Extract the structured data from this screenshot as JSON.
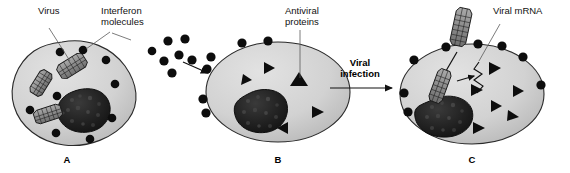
{
  "figure": {
    "background": "#ffffff",
    "cell_fill": "#d2d2d2",
    "nucleus_fill": "#1c1c1c",
    "particle_color": "#0d0d0d"
  },
  "labels": {
    "virus": "Virus",
    "interferon_line1": "Interferon",
    "interferon_line2": "molecules",
    "antiviral_line1": "Antiviral",
    "antiviral_line2": "proteins",
    "viral_infection_line1": "Viral",
    "viral_infection_line2": "infection",
    "viral_mrna": "Viral mRNA"
  },
  "panels": [
    {
      "id": "A",
      "letter": "A",
      "shape": "irregular-amoeboid",
      "virus_count": 3,
      "interferon_dot_count": 9,
      "antiviral_triangle_count": 0,
      "has_nucleus": true,
      "description": "Virus-infected cell producing interferon molecules"
    },
    {
      "id": "B",
      "letter": "B",
      "shape": "oval",
      "virus_count": 0,
      "interferon_dot_count": 6,
      "antiviral_triangle_count": 5,
      "has_nucleus": true,
      "description": "Neighbouring cell binding interferon and making antiviral proteins"
    },
    {
      "id": "C",
      "letter": "C",
      "shape": "oval",
      "virus_count": 2,
      "interferon_dot_count": 8,
      "antiviral_triangle_count": 6,
      "has_nucleus": true,
      "description": "Cell infected by virus; antiviral proteins block viral mRNA"
    }
  ],
  "free_interferon_cluster": {
    "count": 7,
    "description": "Interferon molecules released between cell A and cell B"
  },
  "arrows": [
    {
      "name": "interferon-diffusion-arrow",
      "from": "A",
      "to": "B"
    },
    {
      "name": "viral-infection-arrow",
      "from": "B",
      "to": "C"
    },
    {
      "name": "virus-entry-arrow",
      "from": "outside",
      "to": "C"
    },
    {
      "name": "mrna-block-arrow",
      "from": "virus",
      "to": "mRNA"
    }
  ]
}
